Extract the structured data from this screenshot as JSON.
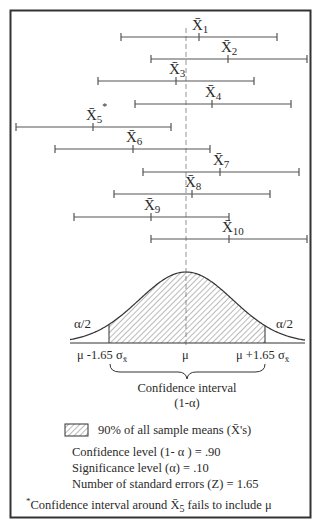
{
  "figure": {
    "border_color": "#333333",
    "line_color": "#555555",
    "mu_line": {
      "x": 186,
      "dashed": true
    }
  },
  "chart_data": {
    "type": "confidence-interval-diagram",
    "title": "",
    "mu_x": 186,
    "intervals": [
      {
        "label": "X̄",
        "sub": "1",
        "star": "",
        "left": 121,
        "mean": 199,
        "right": 277,
        "y": 37
      },
      {
        "label": "X̄",
        "sub": "2",
        "star": "",
        "left": 151,
        "mean": 228,
        "right": 307,
        "y": 59
      },
      {
        "label": "X̄",
        "sub": "3",
        "star": "",
        "left": 98,
        "mean": 176,
        "right": 254,
        "y": 81
      },
      {
        "label": "X̄",
        "sub": "4",
        "star": "",
        "left": 135,
        "mean": 212,
        "right": 291,
        "y": 104
      },
      {
        "label": "X̄",
        "sub": "5",
        "star": "*",
        "left": 16,
        "mean": 93,
        "right": 171,
        "y": 127
      },
      {
        "label": "X̄",
        "sub": "6",
        "star": "",
        "left": 55,
        "mean": 133,
        "right": 210,
        "y": 149
      },
      {
        "label": "X̄",
        "sub": "7",
        "star": "",
        "left": 143,
        "mean": 220,
        "right": 299,
        "y": 172
      },
      {
        "label": "X̄",
        "sub": "8",
        "star": "",
        "left": 114,
        "mean": 192,
        "right": 270,
        "y": 194
      },
      {
        "label": "X̄",
        "sub": "9",
        "star": "",
        "left": 74,
        "mean": 151,
        "right": 229,
        "y": 217
      },
      {
        "label": "X̄",
        "sub": "10",
        "star": "",
        "left": 151,
        "mean": 229,
        "right": 307,
        "y": 239
      }
    ],
    "distribution": {
      "shaded_percent": 90,
      "left_tail_label": "α/2",
      "right_tail_label": "α/2",
      "lower_bound_label": "μ -1.65 σ",
      "center_label": "μ",
      "upper_bound_label": "μ +1.65 σ",
      "sigma_sub": "x̄",
      "brace_label_line1": "Confidence interval",
      "brace_label_line2": "(1-α)"
    },
    "legend": {
      "swatch": "hatched",
      "text": "90% of all sample means (X̄'s)"
    },
    "stats": [
      "Confidence level (1- α ) = .90",
      "Significance level (α) = .10",
      "Number of standard errors (Z) = 1.65"
    ],
    "footnote": {
      "star": "*",
      "before": "Confidence interval around ",
      "xbar": "X̄",
      "sub": "5",
      "after": "  fails to include ",
      "mu": "μ"
    }
  }
}
